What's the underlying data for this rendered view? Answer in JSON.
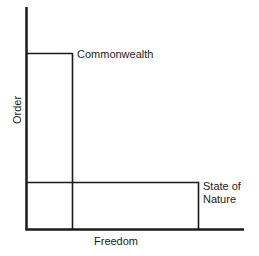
{
  "diagram": {
    "axes": {
      "x_label": "Freedom",
      "y_label": "Order"
    },
    "regions": [
      {
        "label": "Commonwealth",
        "freedom_extent": "low",
        "order_extent": "high"
      },
      {
        "label_line1": "State of",
        "label_line2": "Nature",
        "freedom_extent": "high",
        "order_extent": "low"
      }
    ],
    "colors": {
      "line": "#1a1a1a",
      "background": "#ffffff"
    }
  }
}
